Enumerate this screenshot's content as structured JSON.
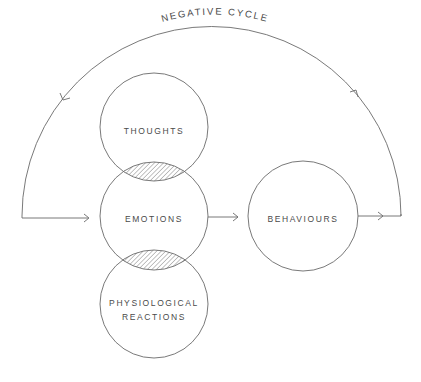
{
  "diagram": {
    "cycle_label": "NEGATIVE CYCLE",
    "nodes": {
      "thoughts": "THOUGHTS",
      "emotions": "EMOTIONS",
      "physiological_line1": "PHYSIOLOGICAL",
      "physiological_line2": "REACTIONS",
      "behaviours": "BEHAVIOURS"
    },
    "colors": {
      "line": "#6a6a6a",
      "text": "#4a4a4a",
      "background": "#ffffff"
    }
  }
}
